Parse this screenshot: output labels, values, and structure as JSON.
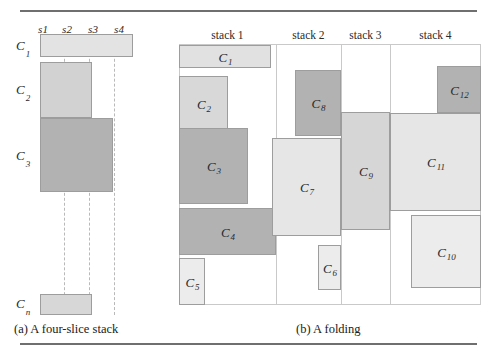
{
  "figure": {
    "captions": {
      "a": "(a) A four-slice stack",
      "b": "(b) A folding"
    }
  },
  "colors": {
    "light": "#e3e3e3",
    "medium": "#cfcfcf",
    "dark": "#b2b2b2",
    "border": "#9d9d9d",
    "rule": "#6f6f6f",
    "dashed": "#b9b9b9",
    "separator": "#c9c9c9"
  },
  "stack_panel": {
    "slice_headers": [
      {
        "label": "s1"
      },
      {
        "label": "s2"
      },
      {
        "label": "s3"
      },
      {
        "label": "s4"
      }
    ],
    "row_labels": [
      {
        "label": "C",
        "sub": "1"
      },
      {
        "label": "C",
        "sub": "2"
      },
      {
        "label": "C",
        "sub": "3"
      },
      {
        "label": "C",
        "sub": "n"
      }
    ],
    "bars": [
      {
        "name": "C1",
        "label": "C",
        "sub": "1",
        "slices": 4,
        "shade": "light"
      },
      {
        "name": "C2",
        "label": "C",
        "sub": "2",
        "slices": 2,
        "shade": "medium"
      },
      {
        "name": "C3",
        "label": "C",
        "sub": "3",
        "slices": 3,
        "shade": "dark"
      },
      {
        "name": "Cn",
        "label": "C",
        "sub": "n",
        "slices": 2,
        "shade": "medium"
      }
    ]
  },
  "folding_panel": {
    "column_headers": [
      {
        "label": "stack 1"
      },
      {
        "label": "stack 2"
      },
      {
        "label": "stack 3"
      },
      {
        "label": "stack 4"
      }
    ],
    "blocks": [
      {
        "name": "C1",
        "label": "C",
        "sub": "1",
        "shade": "light",
        "stack": 1
      },
      {
        "name": "C2",
        "label": "C",
        "sub": "2",
        "shade": "medium",
        "stack": 1
      },
      {
        "name": "C3",
        "label": "C",
        "sub": "3",
        "shade": "dark",
        "stack": 1
      },
      {
        "name": "C4",
        "label": "C",
        "sub": "4",
        "shade": "dark",
        "stack": 1
      },
      {
        "name": "C5",
        "label": "C",
        "sub": "5",
        "shade": "light",
        "stack": 1
      },
      {
        "name": "C6",
        "label": "C",
        "sub": "6",
        "shade": "light",
        "stack": 2
      },
      {
        "name": "C7",
        "label": "C",
        "sub": "7",
        "shade": "light",
        "stack": 2
      },
      {
        "name": "C8",
        "label": "C",
        "sub": "8",
        "shade": "dark",
        "stack": 2
      },
      {
        "name": "C9",
        "label": "C",
        "sub": "9",
        "shade": "medium",
        "stack": 3
      },
      {
        "name": "C10",
        "label": "C",
        "sub": "10",
        "shade": "light",
        "stack": 4
      },
      {
        "name": "C11",
        "label": "C",
        "sub": "11",
        "shade": "light",
        "stack": 4
      },
      {
        "name": "C12",
        "label": "C",
        "sub": "12",
        "shade": "dark",
        "stack": 4
      }
    ]
  }
}
